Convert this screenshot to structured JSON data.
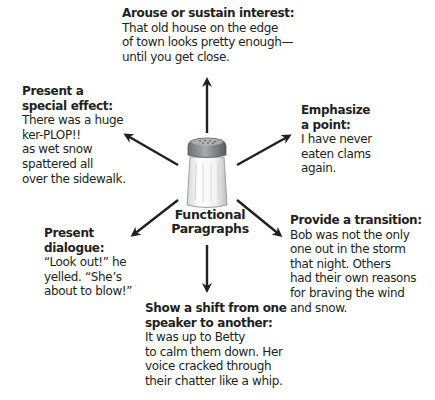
{
  "center": {
    "label_line1": "Functional",
    "label_line2": "Paragraphs",
    "icon": "salt-shaker-icon"
  },
  "functions": [
    {
      "id": "top",
      "title": "Arouse or sustain interest:",
      "lines": [
        "That old house on the edge",
        "of town looks pretty enough—",
        "until you get close."
      ]
    },
    {
      "id": "upper-left",
      "title_lines": [
        "Present a",
        "special effect:"
      ],
      "lines": [
        "There was a huge",
        "ker-PLOP!!",
        "as wet snow",
        "spattered all",
        "over the sidewalk."
      ]
    },
    {
      "id": "upper-right",
      "title_lines": [
        "Emphasize",
        "a point:"
      ],
      "lines": [
        "I have never",
        "eaten clams",
        "again."
      ]
    },
    {
      "id": "lower-left",
      "title_lines": [
        "Present",
        "dialogue:"
      ],
      "lines": [
        "“Look out!” he",
        "yelled. “She’s",
        "about to blow!”"
      ]
    },
    {
      "id": "lower-right",
      "title": "Provide a transition:",
      "lines": [
        "Bob was not the only",
        "one out in the storm",
        "that night. Others",
        "had their own reasons",
        "for braving the wind",
        "and snow."
      ]
    },
    {
      "id": "bottom",
      "title_lines": [
        "Show a shift from one",
        "speaker to another:"
      ],
      "lines": [
        "It was up to Betty",
        "to calm them down. Her",
        "voice cracked through",
        "their chatter like a whip."
      ]
    }
  ],
  "colors": {
    "text": "#231f20",
    "arrow": "#231f20",
    "shaker_cap": "#8a8c8e",
    "shaker_body": "#f2f2f2"
  }
}
